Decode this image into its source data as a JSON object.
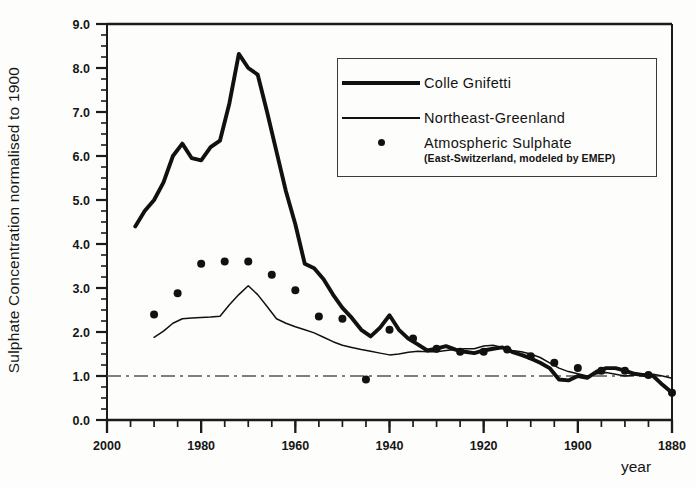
{
  "chart_data": {
    "type": "line",
    "title": "",
    "xlabel": "year",
    "ylabel": "Sulphate Concentration normalised to 1900",
    "xlim": [
      2000,
      1880
    ],
    "ylim": [
      0.0,
      9.0
    ],
    "x_reversed": true,
    "grid": false,
    "x_major_ticks": [
      2000,
      1980,
      1960,
      1940,
      1920,
      1900,
      1880
    ],
    "x_major_tick_labels": [
      "2000",
      "1980",
      "1960",
      "1940",
      "1920",
      "1900",
      "1880"
    ],
    "x_minor_tick_step": 5,
    "y_major_ticks": [
      0.0,
      1.0,
      2.0,
      3.0,
      4.0,
      5.0,
      6.0,
      7.0,
      8.0,
      9.0
    ],
    "y_major_tick_labels": [
      "0.0",
      "1.0",
      "2.0",
      "3.0",
      "4.0",
      "5.0",
      "6.0",
      "7.0",
      "8.0",
      "9.0"
    ],
    "y_minor_tick_step": 0.25,
    "reference_line": {
      "y": 1.0,
      "style": "dash-dot",
      "label": "normalised to 1900"
    },
    "legend_position": "top-right",
    "series": [
      {
        "name": "Colle Gnifetti",
        "style": "thick-line",
        "color": "#111111",
        "points": [
          [
            1994,
            4.4
          ],
          [
            1992,
            4.75
          ],
          [
            1990,
            5.0
          ],
          [
            1988,
            5.4
          ],
          [
            1986,
            6.0
          ],
          [
            1984,
            6.28
          ],
          [
            1982,
            5.95
          ],
          [
            1980,
            5.9
          ],
          [
            1978,
            6.2
          ],
          [
            1976,
            6.35
          ],
          [
            1974,
            7.2
          ],
          [
            1972,
            8.32
          ],
          [
            1970,
            8.0
          ],
          [
            1968,
            7.85
          ],
          [
            1966,
            7.0
          ],
          [
            1964,
            6.1
          ],
          [
            1962,
            5.2
          ],
          [
            1960,
            4.45
          ],
          [
            1958,
            3.55
          ],
          [
            1956,
            3.45
          ],
          [
            1954,
            3.2
          ],
          [
            1952,
            2.85
          ],
          [
            1950,
            2.55
          ],
          [
            1948,
            2.32
          ],
          [
            1946,
            2.05
          ],
          [
            1944,
            1.9
          ],
          [
            1942,
            2.1
          ],
          [
            1940,
            2.38
          ],
          [
            1938,
            2.05
          ],
          [
            1936,
            1.85
          ],
          [
            1934,
            1.72
          ],
          [
            1932,
            1.58
          ],
          [
            1930,
            1.62
          ],
          [
            1928,
            1.68
          ],
          [
            1926,
            1.6
          ],
          [
            1924,
            1.55
          ],
          [
            1922,
            1.52
          ],
          [
            1920,
            1.58
          ],
          [
            1918,
            1.62
          ],
          [
            1916,
            1.65
          ],
          [
            1914,
            1.55
          ],
          [
            1912,
            1.48
          ],
          [
            1910,
            1.4
          ],
          [
            1908,
            1.3
          ],
          [
            1906,
            1.18
          ],
          [
            1904,
            0.92
          ],
          [
            1902,
            0.9
          ],
          [
            1900,
            1.0
          ],
          [
            1898,
            0.96
          ],
          [
            1896,
            1.1
          ],
          [
            1894,
            1.18
          ],
          [
            1892,
            1.18
          ],
          [
            1890,
            1.12
          ],
          [
            1888,
            1.05
          ],
          [
            1886,
            1.02
          ],
          [
            1884,
            1.0
          ],
          [
            1882,
            0.8
          ],
          [
            1880,
            0.62
          ]
        ]
      },
      {
        "name": "Northeast-Greenland",
        "style": "thin-line",
        "color": "#111111",
        "points": [
          [
            1990,
            1.88
          ],
          [
            1988,
            2.02
          ],
          [
            1986,
            2.2
          ],
          [
            1984,
            2.3
          ],
          [
            1982,
            2.32
          ],
          [
            1980,
            2.33
          ],
          [
            1978,
            2.34
          ],
          [
            1976,
            2.36
          ],
          [
            1974,
            2.62
          ],
          [
            1972,
            2.85
          ],
          [
            1970,
            3.05
          ],
          [
            1968,
            2.85
          ],
          [
            1966,
            2.58
          ],
          [
            1964,
            2.3
          ],
          [
            1962,
            2.2
          ],
          [
            1960,
            2.12
          ],
          [
            1958,
            2.05
          ],
          [
            1956,
            1.98
          ],
          [
            1954,
            1.88
          ],
          [
            1952,
            1.78
          ],
          [
            1950,
            1.7
          ],
          [
            1948,
            1.65
          ],
          [
            1946,
            1.6
          ],
          [
            1944,
            1.56
          ],
          [
            1942,
            1.52
          ],
          [
            1940,
            1.48
          ],
          [
            1938,
            1.5
          ],
          [
            1936,
            1.54
          ],
          [
            1934,
            1.56
          ],
          [
            1932,
            1.55
          ],
          [
            1930,
            1.55
          ],
          [
            1928,
            1.58
          ],
          [
            1926,
            1.6
          ],
          [
            1924,
            1.62
          ],
          [
            1922,
            1.62
          ],
          [
            1920,
            1.68
          ],
          [
            1918,
            1.7
          ],
          [
            1916,
            1.65
          ],
          [
            1914,
            1.58
          ],
          [
            1912,
            1.55
          ],
          [
            1910,
            1.5
          ],
          [
            1908,
            1.42
          ],
          [
            1906,
            1.3
          ],
          [
            1904,
            1.18
          ],
          [
            1902,
            1.1
          ],
          [
            1900,
            1.05
          ],
          [
            1898,
            1.0
          ],
          [
            1896,
            1.05
          ],
          [
            1894,
            1.08
          ],
          [
            1892,
            1.04
          ],
          [
            1890,
            1.0
          ],
          [
            1888,
            1.02
          ],
          [
            1886,
            1.05
          ],
          [
            1884,
            1.04
          ],
          [
            1882,
            1.0
          ],
          [
            1880,
            0.95
          ]
        ]
      },
      {
        "name": "Atmospheric Sulphate",
        "sublabel": "(East-Switzerland, modeled by EMEP)",
        "style": "dots",
        "color": "#111111",
        "points": [
          [
            1990,
            2.4
          ],
          [
            1985,
            2.88
          ],
          [
            1980,
            3.55
          ],
          [
            1975,
            3.6
          ],
          [
            1970,
            3.6
          ],
          [
            1965,
            3.3
          ],
          [
            1960,
            2.95
          ],
          [
            1955,
            2.35
          ],
          [
            1950,
            2.3
          ],
          [
            1945,
            0.92
          ],
          [
            1940,
            2.05
          ],
          [
            1935,
            1.85
          ],
          [
            1930,
            1.62
          ],
          [
            1925,
            1.55
          ],
          [
            1920,
            1.55
          ],
          [
            1915,
            1.6
          ],
          [
            1910,
            1.45
          ],
          [
            1905,
            1.3
          ],
          [
            1900,
            1.18
          ],
          [
            1895,
            1.12
          ],
          [
            1890,
            1.12
          ],
          [
            1885,
            1.02
          ],
          [
            1880,
            0.62
          ]
        ]
      }
    ]
  },
  "axis": {
    "y_title": "Sulphate Concentration normalised to 1900",
    "x_title": "year"
  },
  "legend": {
    "items": [
      {
        "key": "thick-line",
        "label": "Colle Gnifetti",
        "sublabel": ""
      },
      {
        "key": "thin-line",
        "label": "Northeast-Greenland",
        "sublabel": ""
      },
      {
        "key": "dot",
        "label": "Atmospheric Sulphate",
        "sublabel": "(East-Switzerland, modeled by EMEP)"
      }
    ]
  },
  "colors": {
    "ink": "#111111",
    "frame": "#1b1b1b",
    "background": "#fdfdfb"
  }
}
